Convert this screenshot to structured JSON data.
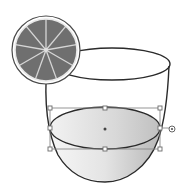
{
  "canvas": {
    "width": 191,
    "height": 194,
    "background": "#ffffff"
  },
  "colors": {
    "stroke": "#2a2a2a",
    "slice_fill": "#6f6f6f",
    "slice_rim": "#f4f4f4",
    "segment_lines": "#cfcfcf",
    "liquid_light": "#f4f4f4",
    "liquid_dark": "#bdbdbd",
    "bbox": "#8a8a8a",
    "handle_fill": "#ffffff"
  },
  "objects": {
    "orange_slice": {
      "cx": 46,
      "cy": 50,
      "r_outer": 34,
      "r_inner": 30,
      "segments": 9
    },
    "glass": {
      "rim_cx": 112,
      "rim_cy": 64,
      "rim_rx": 58,
      "rim_ry": 16
    },
    "liquid": {
      "cx": 105,
      "cy": 128,
      "rx": 55,
      "ry": 22,
      "bottom_y": 180
    },
    "selection": {
      "x": 50,
      "y": 108,
      "w": 110,
      "h": 41,
      "center_x": 105,
      "center_y": 128,
      "rotate_handle_x": 172,
      "rotate_handle_y": 130
    }
  }
}
